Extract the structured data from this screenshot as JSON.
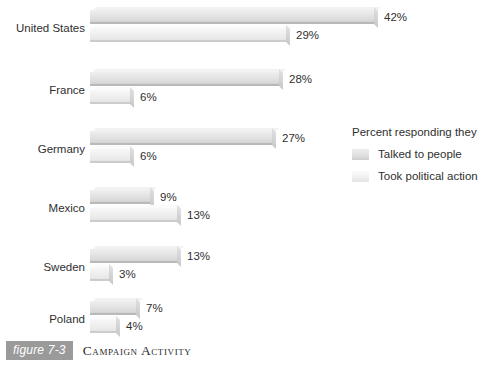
{
  "chart_data": {
    "type": "bar",
    "orientation": "horizontal",
    "title": "Campaign Activity",
    "figure_number": "figure 7-3",
    "xlabel": "",
    "ylabel": "",
    "xlim": [
      0,
      45
    ],
    "grid": false,
    "legend_position": "right",
    "legend_title": "Percent responding they",
    "categories": [
      "United States",
      "France",
      "Germany",
      "Mexico",
      "Sweden",
      "Poland"
    ],
    "series": [
      {
        "name": "Talked to people",
        "values": [
          42,
          28,
          27,
          9,
          13,
          7
        ],
        "value_labels": [
          "42%",
          "28%",
          "27%",
          "9%",
          "13%",
          "7%"
        ],
        "color": "#e2e2e2"
      },
      {
        "name": "Took political action",
        "values": [
          29,
          6,
          6,
          13,
          3,
          4
        ],
        "value_labels": [
          "29%",
          "6%",
          "6%",
          "13%",
          "3%",
          "4%"
        ],
        "color": "#f2f2f2"
      }
    ]
  },
  "caption": {
    "tag": "figure 7-3",
    "title": "Campaign Activity"
  },
  "legend": {
    "title": "Percent responding they",
    "items": [
      {
        "label": "Talked to people"
      },
      {
        "label": "Took political action"
      }
    ]
  },
  "layout": {
    "px_per_percent": 6.78,
    "bar_left_px": 90,
    "group_tops": [
      10,
      72,
      131,
      190,
      249,
      301
    ],
    "bar_height": 14,
    "bar_gap": 18
  }
}
